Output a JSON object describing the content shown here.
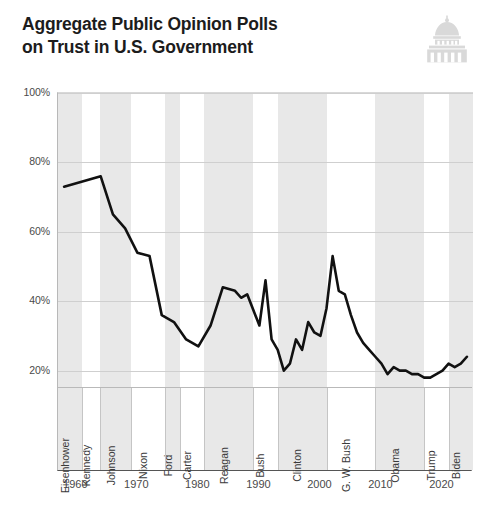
{
  "header": {
    "title": "Aggregate Public Opinion Polls\non Trust in U.S. Government",
    "icon": "capitol-dome-icon"
  },
  "colors": {
    "line": "#111111",
    "band": "#e8e8e8",
    "gridline": "#cfcfcf",
    "axis": "#555555",
    "text": "#3a3a3a",
    "icon": "#d9d9d9",
    "background": "#ffffff"
  },
  "chart_data": {
    "type": "line",
    "title": "Aggregate Public Opinion Polls on Trust in U.S. Government",
    "xlabel": "",
    "ylabel": "",
    "xlim": [
      1957,
      2025
    ],
    "ylim": [
      15,
      100
    ],
    "grid": true,
    "legend": "none",
    "y_ticks": [
      "20%",
      "40%",
      "60%",
      "80%",
      "100%"
    ],
    "y_tick_values": [
      20,
      40,
      60,
      80,
      100
    ],
    "x_ticks": [
      "1960",
      "1970",
      "1980",
      "1990",
      "2000",
      "2010",
      "2020"
    ],
    "x_tick_values": [
      1960,
      1970,
      1980,
      1990,
      2000,
      2010,
      2020
    ],
    "series": [
      {
        "name": "Trust in U.S. Government",
        "units": "percent",
        "x": [
          1958,
          1960,
          1962,
          1964,
          1966,
          1968,
          1970,
          1972,
          1974,
          1976,
          1978,
          1980,
          1982,
          1984,
          1986,
          1987,
          1988,
          1990,
          1991,
          1992,
          1993,
          1994,
          1995,
          1996,
          1997,
          1998,
          1999,
          2000,
          2001,
          2002,
          2003,
          2004,
          2005,
          2006,
          2007,
          2008,
          2009,
          2010,
          2011,
          2012,
          2013,
          2014,
          2015,
          2016,
          2017,
          2018,
          2019,
          2020,
          2021,
          2022,
          2023,
          2024
        ],
        "values": [
          73,
          74,
          75,
          76,
          65,
          61,
          54,
          53,
          36,
          34,
          29,
          27,
          33,
          44,
          43,
          41,
          42,
          33,
          46,
          29,
          26,
          20,
          22,
          29,
          26,
          34,
          31,
          30,
          38,
          53,
          43,
          42,
          36,
          31,
          28,
          26,
          24,
          22,
          19,
          21,
          20,
          20,
          19,
          19,
          18,
          18,
          19,
          20,
          22,
          21,
          22,
          24
        ]
      }
    ],
    "annotations": [
      {
        "label": "Peak trust",
        "year": 1964,
        "value": 76
      },
      {
        "label": "Post-Watergate low",
        "year": 1980,
        "value": 27
      },
      {
        "label": "Gulf War spike",
        "year": 1991,
        "value": 46
      },
      {
        "label": "Mid-90s low",
        "year": 1994,
        "value": 20
      },
      {
        "label": "Post-9/11 peak",
        "year": 2002,
        "value": 53
      },
      {
        "label": "Recent low",
        "year": 2017,
        "value": 18
      },
      {
        "label": "Latest",
        "year": 2024,
        "value": 24
      }
    ],
    "presidential_terms": [
      {
        "name": "Eisenhower",
        "start": 1957,
        "end": 1961,
        "shaded": true
      },
      {
        "name": "Kennedy",
        "start": 1961,
        "end": 1963.9,
        "shaded": false
      },
      {
        "name": "Johnson",
        "start": 1963.9,
        "end": 1969,
        "shaded": true
      },
      {
        "name": "Nixon",
        "start": 1969,
        "end": 1974.6,
        "shaded": false
      },
      {
        "name": "Ford",
        "start": 1974.6,
        "end": 1977,
        "shaded": true
      },
      {
        "name": "Carter",
        "start": 1977,
        "end": 1981,
        "shaded": false
      },
      {
        "name": "Reagan",
        "start": 1981,
        "end": 1989,
        "shaded": true
      },
      {
        "name": "Bush",
        "start": 1989,
        "end": 1993,
        "shaded": false
      },
      {
        "name": "Clinton",
        "start": 1993,
        "end": 2001,
        "shaded": true
      },
      {
        "name": "G. W. Bush",
        "start": 2001,
        "end": 2009,
        "shaded": false
      },
      {
        "name": "Obama",
        "start": 2009,
        "end": 2017,
        "shaded": true
      },
      {
        "name": "Trump",
        "start": 2017,
        "end": 2021,
        "shaded": false
      },
      {
        "name": "Biden",
        "start": 2021,
        "end": 2025,
        "shaded": true
      }
    ]
  }
}
